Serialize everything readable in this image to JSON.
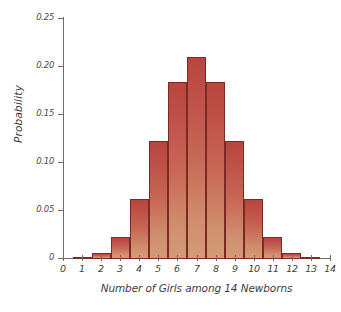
{
  "chart_data": {
    "type": "bar",
    "title": "",
    "xlabel": "Number of Girls among 14 Newborns",
    "ylabel": "Probability",
    "categories": [
      "0",
      "1",
      "2",
      "3",
      "4",
      "5",
      "6",
      "7",
      "8",
      "9",
      "10",
      "11",
      "12",
      "13",
      "14"
    ],
    "values": [
      0.0001,
      0.0009,
      0.0056,
      0.0222,
      0.0611,
      0.1222,
      0.1833,
      0.2095,
      0.1833,
      0.1222,
      0.0611,
      0.0222,
      0.0056,
      0.0009,
      0.0001
    ],
    "xlim": [
      0,
      14
    ],
    "ylim": [
      0,
      0.25
    ],
    "ytick_labels": [
      "0.25",
      "0.20",
      "0.15",
      "0.10",
      "0.05",
      "0"
    ],
    "ytick_values": [
      0.25,
      0.2,
      0.15,
      0.1,
      0.05,
      0
    ],
    "xtick_labels": [
      "0",
      "1",
      "2",
      "3",
      "4",
      "5",
      "6",
      "7",
      "8",
      "9",
      "10",
      "11",
      "12",
      "13",
      "14"
    ],
    "grid": false,
    "legend": false,
    "bar_fill_top_color": "#b8453e",
    "bar_fill_bottom_color": "#d39b78",
    "bar_edge_color": "#7e2a24",
    "axis_color": "#6b6b6b",
    "text_color": "#3d3d3d",
    "background_color": "#ffffff"
  }
}
